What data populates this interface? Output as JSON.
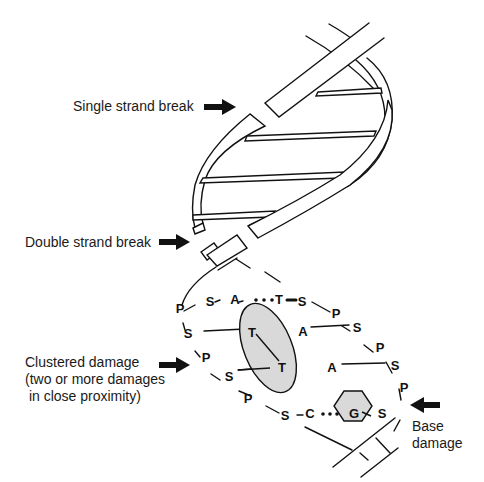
{
  "labels": {
    "single_strand_break": "Single strand break",
    "double_strand_break": "Double strand break",
    "clustered_damage_line1": "Clustered damage",
    "clustered_damage_line2": "(two or more damages",
    "clustered_damage_line3": " in close proximity)",
    "base_damage_line1": "Base",
    "base_damage_line2": "damage"
  },
  "nucleotides": {
    "strand_left": [
      "P",
      "S",
      "P",
      "S",
      "P",
      "S"
    ],
    "strand_right": [
      "S",
      "P",
      "S",
      "P",
      "S",
      "P",
      "S"
    ],
    "top_pair": [
      "S",
      "A",
      "T",
      "S"
    ],
    "bottom_pair": [
      "S",
      "C",
      "G",
      "S"
    ],
    "inner": [
      "T",
      "T",
      "A",
      "A"
    ]
  },
  "colors": {
    "line": "#111111",
    "highlight_fill": "#d9d9d9",
    "background": "#ffffff"
  }
}
